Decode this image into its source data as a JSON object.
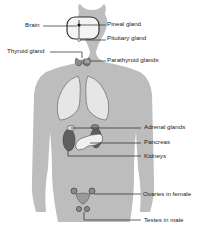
{
  "diagram": {
    "colors": {
      "body": "#b9b9b9",
      "organ_light": "#e6e6e6",
      "organ_dark": "#6a6a6a",
      "gland": "#8f8f8f",
      "line": "#222222"
    },
    "labels": {
      "brain": "Brain",
      "pineal": "Pineal gland",
      "pituitary": "Pituitary gland",
      "thyroid": "Thyroid gland",
      "parathyroid": "Parathyroid glands",
      "adrenal": "Adrenal glands",
      "pancreas": "Pancreas",
      "kidneys": "Kidneys",
      "ovaries": "Ovaries in female",
      "testes": "Testes in male"
    }
  }
}
